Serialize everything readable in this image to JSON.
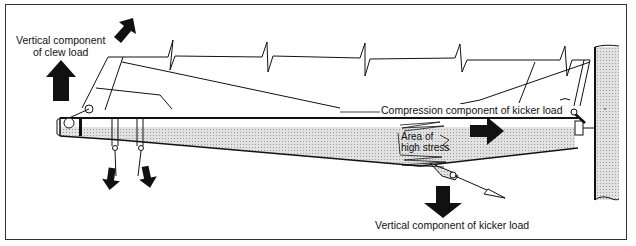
{
  "diagram": {
    "labels": {
      "clew_line1": "Vertical component",
      "clew_line2": "of clew load",
      "compression": "Compression component of kicker load",
      "stress_line1": "Area of",
      "stress_line2": "high stress",
      "kicker_vertical": "Vertical component of kicker load"
    },
    "elements": [
      {
        "name": "boom",
        "shape": "tapered tube, shaded lower half"
      },
      {
        "name": "mast",
        "shape": "vertical shaded tube at right"
      },
      {
        "name": "sail",
        "shape": "outline with break marks"
      },
      {
        "name": "kicker",
        "shape": "strut from boom underside"
      },
      {
        "name": "sheet-blocks",
        "count": 2
      }
    ],
    "arrows": [
      {
        "id": "clew-vertical",
        "direction": "up"
      },
      {
        "id": "clew-diagonal",
        "direction": "up-right"
      },
      {
        "id": "compression",
        "direction": "right"
      },
      {
        "id": "kicker-vertical",
        "direction": "down"
      },
      {
        "id": "sheet-1",
        "direction": "down"
      },
      {
        "id": "sheet-2",
        "direction": "down"
      }
    ],
    "colors": {
      "line": "#111111",
      "shade": "#cfcfcf",
      "background": "#ffffff"
    }
  }
}
